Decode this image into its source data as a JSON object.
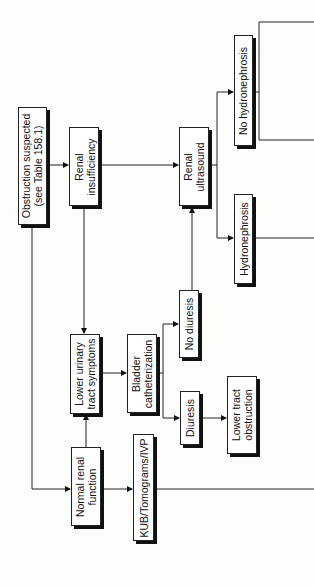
{
  "diagram": {
    "orientation": "rotated -90deg (reads bottom-to-top)",
    "nodes": {
      "obstruction": {
        "line1": "Obstruction suspected",
        "line2": "(see Table 158.1)"
      },
      "renal_insufficiency": {
        "line1": "Renal",
        "line2": "insufficiency"
      },
      "lower_urinary": {
        "line1": "Lower urinary",
        "line2": "tract symptoms"
      },
      "normal_renal": {
        "line1": "Normal renal",
        "line2": "function"
      },
      "bladder_cath": {
        "line1": "Bladder",
        "line2": "catheterization"
      },
      "kub": {
        "line1": "KUB/Tomograms/IVP"
      },
      "no_diuresis": {
        "line1": "No diuresis"
      },
      "diuresis": {
        "line1": "Diuresis"
      },
      "lower_tract_obstruction": {
        "line1": "Lower tract",
        "line2": "obstruction"
      },
      "renal_ultrasound": {
        "line1": "Renal",
        "line2": "ultrasound"
      },
      "hydronephrosis": {
        "line1": "Hydronephrosis"
      },
      "no_hydronephrosis": {
        "line1": "No hydronephrosis"
      }
    },
    "edges": [
      [
        "obstruction",
        "renal_insufficiency"
      ],
      [
        "obstruction",
        "normal_renal"
      ],
      [
        "renal_insufficiency",
        "lower_urinary"
      ],
      [
        "normal_renal",
        "lower_urinary"
      ],
      [
        "renal_insufficiency",
        "renal_ultrasound"
      ],
      [
        "lower_urinary",
        "bladder_cath"
      ],
      [
        "bladder_cath",
        "no_diuresis"
      ],
      [
        "bladder_cath",
        "diuresis"
      ],
      [
        "no_diuresis",
        "renal_ultrasound"
      ],
      [
        "diuresis",
        "lower_tract_obstruction"
      ],
      [
        "normal_renal",
        "kub"
      ],
      [
        "renal_ultrasound",
        "no_hydronephrosis"
      ],
      [
        "renal_ultrasound",
        "hydronephrosis"
      ]
    ]
  }
}
